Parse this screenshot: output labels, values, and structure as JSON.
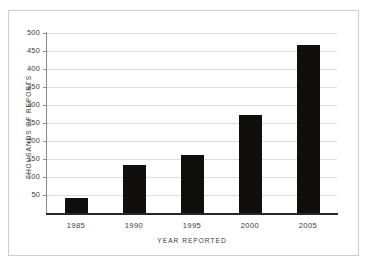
{
  "chart_data": {
    "type": "bar",
    "title": "",
    "subtitle": "",
    "xlabel": "YEAR REPORTED",
    "ylabel": "THOUSANDS OF REPORTS",
    "categories": [
      "1985",
      "1990",
      "1995",
      "2000",
      "2005"
    ],
    "values": [
      43,
      133,
      161,
      271,
      468
    ],
    "series": [
      {
        "name": "Reports",
        "values": [
          43,
          133,
          161,
          271,
          468
        ]
      }
    ],
    "ylim": [
      0,
      500
    ],
    "yticks": [
      50,
      100,
      150,
      200,
      250,
      300,
      350,
      400,
      450,
      500
    ],
    "ytick_labels": [
      "50",
      "100",
      "150",
      "200",
      "250",
      "300",
      "350",
      "400",
      "450",
      "500"
    ],
    "grid": "horizontal",
    "legend": "none",
    "bar_color": "#100f0e",
    "gridline_color": "#dedcdb",
    "axis_color": "#8d8a88",
    "baseline_color": "#2a2827",
    "background_color": "#ffffff",
    "frame_color": "#cfcccb",
    "text_color": "#3c3a39",
    "annotations": []
  }
}
